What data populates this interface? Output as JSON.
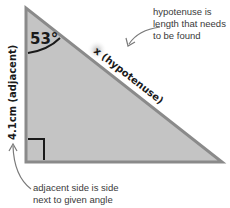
{
  "diagram": {
    "type": "right-triangle",
    "colors": {
      "fill": "#c4c4c4",
      "edge": "#8a8a8a",
      "text": "#1a1a1a",
      "annotation": "#3a3a3a",
      "arrow": "#7a7a7a"
    },
    "angle_label": "53°",
    "hypotenuse_label": "x (hypotenuse)",
    "adjacent_label": "4.1cm (adjacent)",
    "right_angle_marker": true,
    "annotations": {
      "hypotenuse_note": [
        "hypotenuse is",
        "length that needs",
        "to be found"
      ],
      "adjacent_note": [
        "adjacent side is side",
        "next to given angle"
      ]
    }
  }
}
